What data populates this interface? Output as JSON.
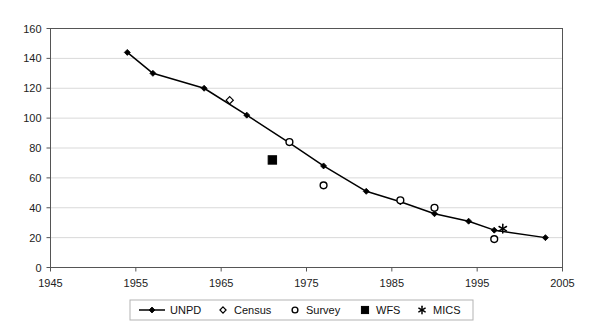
{
  "chart_data": {
    "type": "line",
    "title": "",
    "subtitle": "",
    "xlabel": "",
    "ylabel": "",
    "xlim": [
      1945,
      2005
    ],
    "ylim": [
      0,
      160
    ],
    "x_ticks": [
      1945,
      1955,
      1965,
      1975,
      1985,
      1995,
      2005
    ],
    "y_ticks": [
      0,
      20,
      40,
      60,
      80,
      100,
      120,
      140,
      160
    ],
    "grid": "horizontal",
    "legend_position": "bottom",
    "series": [
      {
        "name": "UNPD",
        "marker": "filled-diamond-line",
        "color": "#000000",
        "points": [
          {
            "x": 1954,
            "y": 144
          },
          {
            "x": 1957,
            "y": 130
          },
          {
            "x": 1963,
            "y": 120
          },
          {
            "x": 1968,
            "y": 102
          },
          {
            "x": 1973,
            "y": 83.5
          },
          {
            "x": 1977,
            "y": 68
          },
          {
            "x": 1982,
            "y": 51
          },
          {
            "x": 1986,
            "y": 44
          },
          {
            "x": 1990,
            "y": 36
          },
          {
            "x": 1994,
            "y": 31
          },
          {
            "x": 1997,
            "y": 25
          },
          {
            "x": 2003,
            "y": 20
          }
        ]
      },
      {
        "name": "Census",
        "marker": "open-diamond",
        "color": "#000000",
        "points": [
          {
            "x": 1966,
            "y": 112
          }
        ]
      },
      {
        "name": "Survey",
        "marker": "open-circle",
        "color": "#000000",
        "points": [
          {
            "x": 1973,
            "y": 84
          },
          {
            "x": 1977,
            "y": 55
          },
          {
            "x": 1986,
            "y": 45
          },
          {
            "x": 1990,
            "y": 40
          },
          {
            "x": 1997,
            "y": 19
          }
        ]
      },
      {
        "name": "WFS",
        "marker": "filled-square",
        "color": "#000000",
        "points": [
          {
            "x": 1971,
            "y": 72
          }
        ]
      },
      {
        "name": "MICS",
        "marker": "asterisk",
        "color": "#000000",
        "points": [
          {
            "x": 1998,
            "y": 26
          }
        ]
      }
    ]
  },
  "axes": {
    "y_tick_labels": [
      "160",
      "140",
      "120",
      "100",
      "80",
      "60",
      "40",
      "20",
      "0"
    ],
    "x_tick_labels": [
      "1945",
      "1955",
      "1965",
      "1975",
      "1985",
      "1995",
      "2005"
    ]
  },
  "legend": {
    "items": [
      {
        "label": "UNPD",
        "marker": "filled-diamond-line"
      },
      {
        "label": "Census",
        "marker": "open-diamond"
      },
      {
        "label": "Survey",
        "marker": "open-circle"
      },
      {
        "label": "WFS",
        "marker": "filled-square"
      },
      {
        "label": "MICS",
        "marker": "asterisk"
      }
    ]
  },
  "colors": {
    "line": "#000000",
    "grid": "#d9d9d9",
    "axis": "#555555",
    "text": "#222222",
    "background": "#ffffff"
  }
}
